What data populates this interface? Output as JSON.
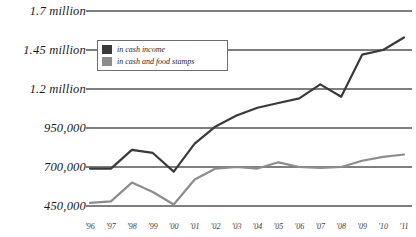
{
  "chart_data": {
    "type": "line",
    "title": "",
    "xlabel": "",
    "ylabel": "",
    "grid": true,
    "legend_position": "top-left-inside",
    "x": [
      "'96",
      "'97",
      "'98",
      "'99",
      "'00",
      "'01",
      "'02",
      "'03",
      "'04",
      "'05",
      "'06",
      "'07",
      "'08",
      "'09",
      "'10",
      "'11"
    ],
    "ytick_labels": [
      "1.7 million",
      "1.45 million",
      "1.2 million",
      "950,000",
      "700,000",
      "450,000"
    ],
    "ytick_values": [
      1700000,
      1450000,
      1200000,
      950000,
      700000,
      450000
    ],
    "ylim": [
      450000,
      1700000
    ],
    "series": [
      {
        "name": "in cash income",
        "color": "#3a3a3a",
        "values": [
          690000,
          690000,
          810000,
          790000,
          670000,
          850000,
          960000,
          1030000,
          1080000,
          1110000,
          1140000,
          1230000,
          1150000,
          1420000,
          1450000,
          1530000
        ]
      },
      {
        "name": "in cash and food stamps",
        "color": "#8c8c8c",
        "values": [
          470000,
          480000,
          600000,
          540000,
          460000,
          620000,
          690000,
          700000,
          690000,
          730000,
          700000,
          695000,
          700000,
          740000,
          765000,
          780000
        ]
      }
    ],
    "legend": [
      {
        "label": "in cash income",
        "color": "#3a3a3a"
      },
      {
        "label": "in cash and food stamps",
        "color": "#8c8c8c"
      }
    ],
    "colors": {
      "cash_income": "#3a3a3a",
      "cash_and_food_stamps": "#8c8c8c",
      "gridline": "#555555",
      "background": "#ffffff"
    }
  }
}
